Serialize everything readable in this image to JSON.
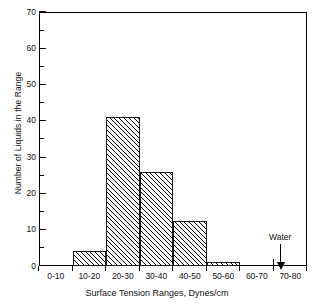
{
  "chart_data": {
    "type": "bar",
    "title": "",
    "xlabel": "Surface Tension Ranges,  Dynes/cm",
    "ylabel": "Number of Liquids in the Range",
    "categories": [
      "0-10",
      "10-20",
      "20-30",
      "30-40",
      "40-50",
      "50-60",
      "60-70",
      "70-80"
    ],
    "values": [
      0,
      4,
      41,
      26,
      12.5,
      1,
      0,
      0
    ],
    "xlim": [
      0,
      80
    ],
    "ylim": [
      0,
      70
    ],
    "ytick_major": [
      0,
      10,
      20,
      30,
      40,
      50,
      60,
      70
    ],
    "ytick_minor": [
      5,
      15,
      25,
      35,
      45,
      55,
      65
    ],
    "xtick_values": [
      0,
      10,
      20,
      30,
      40,
      50,
      60,
      70,
      80
    ],
    "grid": false,
    "legend": "none",
    "fill": "diagonal-hatch",
    "annotations": [
      {
        "label": "Water",
        "x_value": 72,
        "y_value": 0,
        "marker": "down-arrow"
      }
    ]
  },
  "axes": {
    "y": {
      "title": "Number of Liquids in the Range",
      "tick_labels": [
        "0",
        "10",
        "20",
        "30",
        "40",
        "50",
        "60",
        "70"
      ]
    },
    "x": {
      "title": "Surface Tension Ranges,  Dynes/cm",
      "tick_labels": [
        "0-10",
        "10-20",
        "20-30",
        "30-40",
        "40-50",
        "50-60",
        "60-70",
        "70-80"
      ]
    }
  },
  "annotation": {
    "water_label": "Water"
  },
  "colors": {
    "axis": "#000000",
    "bar_edge": "#1a1a1a",
    "hatch": "#000000",
    "background": "#ffffff"
  }
}
